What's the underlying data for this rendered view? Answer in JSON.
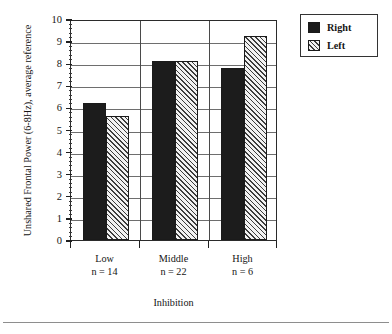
{
  "chart_data": {
    "type": "bar",
    "title": "",
    "xlabel": "Inhibition",
    "ylabel": "Unshared Frontal Power (6-8Hz), average reference",
    "categories": [
      "Low",
      "Middle",
      "High"
    ],
    "category_sublabels": [
      "n = 14",
      "n = 22",
      "n = 6"
    ],
    "series": [
      {
        "name": "Right",
        "values": [
          6.2,
          8.1,
          7.8
        ],
        "fill": "solid",
        "color": "#1c1c1c"
      },
      {
        "name": "Left",
        "values": [
          5.6,
          8.1,
          9.25
        ],
        "fill": "hatch",
        "color": "#f2f2f2"
      }
    ],
    "ylim": [
      0,
      10
    ],
    "ytick_labels": [
      "0",
      "1",
      "2",
      "3",
      "4",
      "5",
      "6",
      "7",
      "8",
      "9",
      "10"
    ],
    "ytick_values": [
      0,
      1,
      2,
      3,
      4,
      5,
      6,
      7,
      8,
      9,
      10
    ],
    "yminor_interval": 0.2,
    "grid": "horizontal-and-vertical-category-separators",
    "legend_position": "outside-top-right"
  },
  "legend": {
    "entries": [
      {
        "label": "Right",
        "fill": "solid"
      },
      {
        "label": "Left",
        "fill": "hatch"
      }
    ]
  },
  "axes": {
    "y_title": "Unshared Frontal Power (6-8Hz), average reference",
    "x_title": "Inhibition"
  }
}
